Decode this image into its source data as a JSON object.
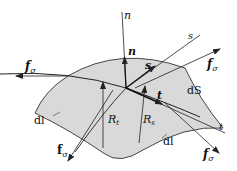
{
  "diagram": {
    "colors": {
      "surface_fill": "#d9d9d9",
      "stroke": "#222222",
      "background": "#ffffff"
    },
    "labels": {
      "n_axis": "n",
      "n_vector": "n",
      "s_axis": "s",
      "s_vector": "s",
      "t_axis": "t",
      "t_vector": "t",
      "area": "dS",
      "radius_t": "R",
      "radius_t_sub": "t",
      "radius_s": "R",
      "radius_s_sub": "s",
      "dl_left": "dl",
      "dl_bottom": "dl",
      "force": "f",
      "force_sub": "σ"
    },
    "forces": [
      {
        "position": "left"
      },
      {
        "position": "upper-right"
      },
      {
        "position": "lower-left"
      },
      {
        "position": "lower-right"
      }
    ]
  }
}
